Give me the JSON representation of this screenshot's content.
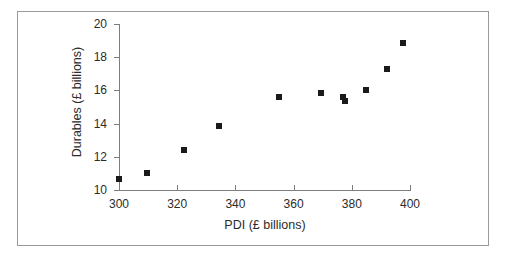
{
  "figure": {
    "frame_border_color": "#9a9a9a",
    "background_color": "#ffffff",
    "axis_color": "#7d7d7d",
    "marker_color": "#1a1a1a"
  },
  "chart_data": {
    "type": "scatter",
    "title": "",
    "xlabel": "PDI (£ billions)",
    "ylabel": "Durables (£ billions)",
    "xlim": [
      300,
      400
    ],
    "ylim": [
      10,
      20
    ],
    "xticks": [
      300,
      320,
      340,
      360,
      380,
      400
    ],
    "yticks": [
      10,
      12,
      14,
      16,
      18,
      20
    ],
    "xtick_labels": [
      "300",
      "320",
      "340",
      "360",
      "380",
      "400"
    ],
    "ytick_labels": [
      "10",
      "12",
      "14",
      "16",
      "18",
      "20"
    ],
    "grid": false,
    "legend": null,
    "marker": "square",
    "series": [
      {
        "name": "Durables vs PDI",
        "points": [
          {
            "x": 300.0,
            "y": 10.65
          },
          {
            "x": 309.5,
            "y": 11.05
          },
          {
            "x": 322.5,
            "y": 12.4
          },
          {
            "x": 334.5,
            "y": 13.85
          },
          {
            "x": 355.0,
            "y": 15.6
          },
          {
            "x": 369.5,
            "y": 15.85
          },
          {
            "x": 377.0,
            "y": 15.6
          },
          {
            "x": 377.5,
            "y": 15.35
          },
          {
            "x": 385.0,
            "y": 16.05
          },
          {
            "x": 392.0,
            "y": 17.3
          },
          {
            "x": 397.5,
            "y": 18.85
          }
        ]
      }
    ]
  }
}
